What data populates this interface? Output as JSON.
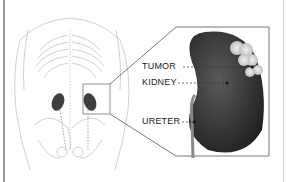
{
  "diagram": {
    "labels": [
      {
        "text": "TUMOR",
        "x": 142,
        "y": 60
      },
      {
        "text": "KIDNEY",
        "x": 142,
        "y": 76
      },
      {
        "text": "URETER",
        "x": 142,
        "y": 114
      }
    ],
    "colors": {
      "body_outline": "#bdbdbd",
      "kidney": "#4a4a4a",
      "tumor": "#d9d9d9",
      "callout_border": "#555555"
    }
  }
}
